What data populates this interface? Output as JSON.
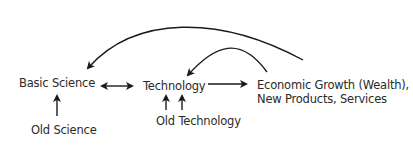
{
  "nodes": {
    "basic_science": "Basic Science",
    "old_science": "Old Science",
    "technology": "Technology",
    "old_technology": "Old Technology",
    "economic_growth_line1": "Economic Growth (Wealth),",
    "economic_growth_line2": "New Products, Services"
  },
  "edges": [
    {
      "from": "Old Science",
      "to": "Basic Science",
      "type": "single-arrow"
    },
    {
      "from": "Basic Science",
      "to": "Technology",
      "type": "double-arrow"
    },
    {
      "from": "Old Technology",
      "to": "Technology",
      "type": "double-up-arrows"
    },
    {
      "from": "Technology",
      "to": "Economic Growth",
      "type": "single-arrow"
    },
    {
      "from": "Economic Growth",
      "to": "Basic Science",
      "type": "curved-feedback-arrow"
    },
    {
      "from": "Economic Growth",
      "to": "Technology",
      "type": "curved-feedback-arrow"
    }
  ],
  "colors": {
    "ink": "#1a1a1a",
    "text": "#2a2a2a",
    "background": "#ffffff"
  }
}
